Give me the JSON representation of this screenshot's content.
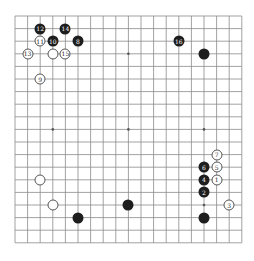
{
  "board": {
    "size": 19,
    "origin_x": 15,
    "origin_y": 16,
    "spacing": 12.6,
    "line_color": "#8a8a8a",
    "hoshi": [
      [
        3,
        3
      ],
      [
        3,
        9
      ],
      [
        3,
        15
      ],
      [
        9,
        3
      ],
      [
        9,
        9
      ],
      [
        9,
        15
      ],
      [
        15,
        3
      ],
      [
        15,
        9
      ],
      [
        15,
        15
      ]
    ]
  },
  "stones": [
    {
      "color": "black",
      "col": 2,
      "row": 1,
      "label": "12"
    },
    {
      "color": "black",
      "col": 4,
      "row": 1,
      "label": "14"
    },
    {
      "color": "white",
      "col": 2,
      "row": 2,
      "label": "11"
    },
    {
      "color": "black",
      "col": 3,
      "row": 2,
      "label": "10"
    },
    {
      "color": "black",
      "col": 5,
      "row": 2,
      "label": "8"
    },
    {
      "color": "white",
      "col": 1,
      "row": 3,
      "label": "13"
    },
    {
      "color": "white",
      "col": 3,
      "row": 3,
      "label": ""
    },
    {
      "color": "white",
      "col": 4,
      "row": 3,
      "label": "15"
    },
    {
      "color": "white",
      "col": 2,
      "row": 5,
      "label": "9"
    },
    {
      "color": "black",
      "col": 13,
      "row": 2,
      "label": "16"
    },
    {
      "color": "black",
      "col": 15,
      "row": 3,
      "label": ""
    },
    {
      "color": "white",
      "col": 16,
      "row": 11,
      "label": "7"
    },
    {
      "color": "black",
      "col": 15,
      "row": 12,
      "label": "6"
    },
    {
      "color": "white",
      "col": 16,
      "row": 12,
      "label": "5"
    },
    {
      "color": "black",
      "col": 15,
      "row": 13,
      "label": "4"
    },
    {
      "color": "white",
      "col": 16,
      "row": 13,
      "label": "1"
    },
    {
      "color": "black",
      "col": 15,
      "row": 14,
      "label": "2"
    },
    {
      "color": "white",
      "col": 17,
      "row": 15,
      "label": "3"
    },
    {
      "color": "black",
      "col": 15,
      "row": 16,
      "label": ""
    },
    {
      "color": "black",
      "col": 9,
      "row": 15,
      "label": ""
    },
    {
      "color": "black",
      "col": 5,
      "row": 16,
      "label": ""
    },
    {
      "color": "white",
      "col": 2,
      "row": 13,
      "label": ""
    },
    {
      "color": "white",
      "col": 3,
      "row": 15,
      "label": ""
    }
  ]
}
